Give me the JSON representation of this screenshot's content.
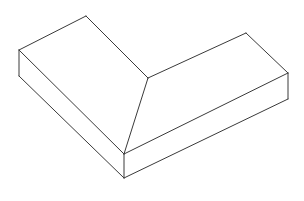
{
  "document": {
    "title": "Isometric L-Shaped Chamfered Block",
    "description": "Wireframe line drawing of an L-shaped prism with two sloped ramp faces meeting at a mitred interior corner",
    "background_color": "#ffffff",
    "line_color": "#3a3a3a",
    "face_color": "#ffffff",
    "line_width": "1",
    "width": "304",
    "height": "201"
  },
  "figure": {
    "name": "l-shaped-ramp-block",
    "projection": "isometric",
    "style": "wireframe-visible-edges",
    "vertices": {
      "left_back_top": "19,50",
      "left_back_bottom": "19,76",
      "left_ridge_apex": "86,16",
      "center_junction": "148,78",
      "right_ridge_apex": "246,33",
      "right_back_top": "288,73",
      "right_back_bottom": "288,99",
      "front_corner_top": "124,154",
      "front_corner_bottom": "124,178"
    },
    "faces": [
      {
        "name": "left-sloped-face",
        "points": "19,50 86,16 148,78 124,154"
      },
      {
        "name": "right-sloped-face",
        "points": "148,78 246,33 288,73 124,154"
      },
      {
        "name": "left-front-side-face",
        "points": "19,50 124,154 124,178 19,76"
      },
      {
        "name": "right-front-side-face",
        "points": "124,154 288,73 288,99 124,178"
      },
      {
        "name": "left-end-face",
        "points": "19,50 19,76 124,178 124,154"
      }
    ],
    "edges": [
      {
        "name": "edge-left-back-top-to-left-apex",
        "d": "M 19,50 L 86,16"
      },
      {
        "name": "edge-left-apex-to-center-junction",
        "d": "M 86,16 L 148,78"
      },
      {
        "name": "edge-center-junction-to-right-apex",
        "d": "M 148,78 L 246,33"
      },
      {
        "name": "edge-right-apex-to-right-back-top",
        "d": "M 246,33 L 288,73"
      },
      {
        "name": "edge-center-junction-to-front-corner-top",
        "d": "M 148,78 L 124,154"
      },
      {
        "name": "edge-left-back-top-to-front-corner-top",
        "d": "M 19,50 L 124,154"
      },
      {
        "name": "edge-front-corner-top-to-right-back-top",
        "d": "M 124,154 L 288,73"
      },
      {
        "name": "edge-left-vertical",
        "d": "M 19,50 L 19,76"
      },
      {
        "name": "edge-front-corner-vertical",
        "d": "M 124,154 L 124,178"
      },
      {
        "name": "edge-right-vertical",
        "d": "M 288,73 L 288,99"
      },
      {
        "name": "edge-left-back-bottom-to-front-corner-bottom",
        "d": "M 19,76 L 124,178"
      },
      {
        "name": "edge-front-corner-bottom-to-right-back-bottom",
        "d": "M 124,178 L 288,99"
      }
    ]
  }
}
